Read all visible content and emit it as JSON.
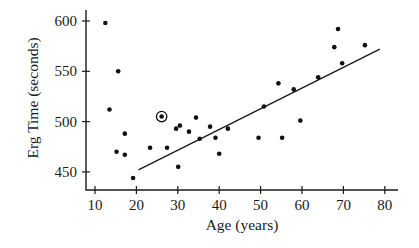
{
  "chart_data": {
    "type": "scatter",
    "title": "",
    "xlabel": "Age (years)",
    "ylabel": "Erg Time (seconds)",
    "xlim": [
      8,
      84
    ],
    "ylim": [
      432,
      610
    ],
    "x_ticks": [
      10,
      20,
      30,
      40,
      50,
      60,
      70,
      80
    ],
    "y_ticks": [
      450,
      500,
      550,
      600
    ],
    "grid": false,
    "legend": null,
    "series": [
      {
        "name": "Rowers",
        "marker": "filled-circle",
        "points": [
          {
            "x": 12.5,
            "y": 598
          },
          {
            "x": 15.6,
            "y": 550
          },
          {
            "x": 13.5,
            "y": 512
          },
          {
            "x": 26.1,
            "y": 505,
            "highlighted": true
          },
          {
            "x": 17.2,
            "y": 488
          },
          {
            "x": 15.2,
            "y": 470
          },
          {
            "x": 17.2,
            "y": 467
          },
          {
            "x": 19.2,
            "y": 444
          },
          {
            "x": 23.3,
            "y": 474
          },
          {
            "x": 27.4,
            "y": 474
          },
          {
            "x": 29.6,
            "y": 493
          },
          {
            "x": 30.5,
            "y": 496
          },
          {
            "x": 30.1,
            "y": 455
          },
          {
            "x": 32.7,
            "y": 490
          },
          {
            "x": 34.4,
            "y": 504
          },
          {
            "x": 35.3,
            "y": 483
          },
          {
            "x": 37.8,
            "y": 495
          },
          {
            "x": 39.1,
            "y": 484
          },
          {
            "x": 40.0,
            "y": 468
          },
          {
            "x": 42.1,
            "y": 493
          },
          {
            "x": 49.5,
            "y": 484
          },
          {
            "x": 50.8,
            "y": 515
          },
          {
            "x": 54.3,
            "y": 538
          },
          {
            "x": 55.2,
            "y": 484
          },
          {
            "x": 58.0,
            "y": 532
          },
          {
            "x": 59.6,
            "y": 501
          },
          {
            "x": 63.9,
            "y": 544
          },
          {
            "x": 67.8,
            "y": 574
          },
          {
            "x": 68.7,
            "y": 592
          },
          {
            "x": 69.7,
            "y": 558
          },
          {
            "x": 75.2,
            "y": 576
          }
        ]
      }
    ],
    "regression_line": {
      "x_start": 20.5,
      "y_start": 452,
      "x_end": 78.8,
      "y_end": 572,
      "slope_approx": 2.06,
      "intercept_approx": 410
    },
    "annotations": [
      {
        "type": "circle-highlight",
        "x": 26.1,
        "y": 505
      }
    ]
  },
  "colors": {
    "ink": "#1a1a1a",
    "background": "#ffffff"
  },
  "layout": {
    "plot_px": {
      "x_axis_y": 190,
      "y_axis_x": 86,
      "x0_val": 10,
      "x0_px": 95,
      "x_px_per_unit": 4.14,
      "y0_val": 600,
      "y0_px": 21,
      "y_px_per_unit": 1.006,
      "x_axis_end_px": 398,
      "y_axis_top_px": 10
    }
  }
}
